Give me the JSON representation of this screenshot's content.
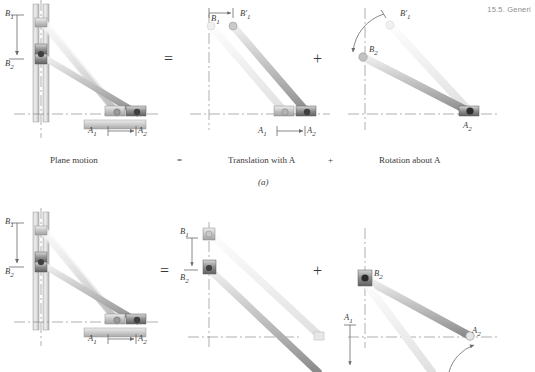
{
  "page": {
    "running_head": "15.5. Generi",
    "width": 535,
    "height": 372
  },
  "colors": {
    "rod_light": "#e9e9e9",
    "rod_mid": "#cfcfcf",
    "rod_dark": "#a8a8a8",
    "ghost": "#f0f0f0",
    "block_dark": "#6e6e6e",
    "block_mid": "#9a9a9a",
    "axis": "#6b6b6b",
    "text": "#2b2b2b",
    "head_text": "#8e8e8e",
    "wall": "#c6c6c6",
    "ground": "#b9b9b9"
  },
  "caption_row": {
    "plane_motion": "Plane motion",
    "equals": "=",
    "translation": "Translation with A",
    "plus": "+",
    "rotation": "Rotation about A",
    "figure_letter": "(a)"
  },
  "operators": {
    "row1_equals": "=",
    "row1_plus": "+",
    "row2_equals": "=",
    "row2_plus": "+"
  },
  "panels": {
    "row1_left": {
      "name": "plane-motion",
      "labels": {
        "b1": "B",
        "b1_sub": "1",
        "b2": "B",
        "b2_sub": "2",
        "a1": "A",
        "a1_sub": "1",
        "a2": "A",
        "a2_sub": "2"
      }
    },
    "row1_middle": {
      "name": "translation-with-a",
      "labels": {
        "b1": "B",
        "b1_sub": "1",
        "b1prime": "B",
        "b1prime_sub": "1",
        "b1prime_prime": "′",
        "a1": "A",
        "a1_sub": "1",
        "a2": "A",
        "a2_sub": "2"
      }
    },
    "row1_right": {
      "name": "rotation-about-a",
      "labels": {
        "b1prime": "B",
        "b1prime_sub": "1",
        "b1prime_prime": "′",
        "b2": "B",
        "b2_sub": "2",
        "a2": "A",
        "a2_sub": "2"
      }
    },
    "row2_left": {
      "name": "plane-motion-b",
      "labels": {
        "b1": "B",
        "b1_sub": "1",
        "b2": "B",
        "b2_sub": "2",
        "a1": "A",
        "a1_sub": "1",
        "a2": "A",
        "a2_sub": "2"
      }
    },
    "row2_middle": {
      "name": "translation-with-b",
      "labels": {
        "b1": "B",
        "b1_sub": "1",
        "b2": "B",
        "b2_sub": "2",
        "a1": "A",
        "a1_sub": "1"
      }
    },
    "row2_right": {
      "name": "rotation-about-b",
      "labels": {
        "b2": "B",
        "b2_sub": "2",
        "a2": "A",
        "a2_sub": "2"
      }
    }
  }
}
